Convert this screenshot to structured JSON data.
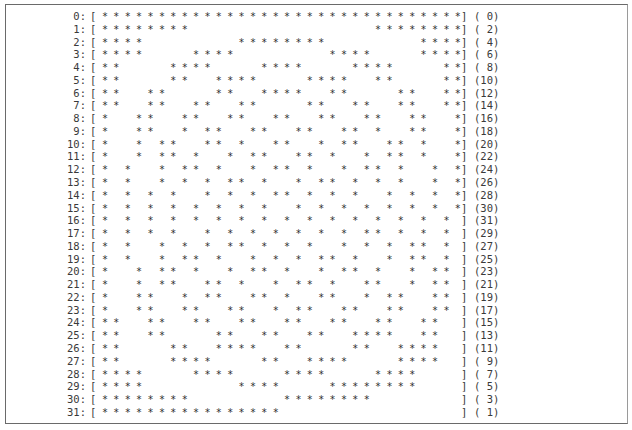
{
  "document": {
    "type": "bit-pattern printout",
    "columns": 32,
    "symbol": "*",
    "left_bracket": "[",
    "right_bracket": "]",
    "rows": [
      {
        "label": "0:",
        "count": "( 0)",
        "cols": [
          0,
          1,
          2,
          3,
          4,
          5,
          6,
          7,
          8,
          9,
          10,
          11,
          12,
          13,
          14,
          15,
          16,
          17,
          18,
          19,
          20,
          21,
          22,
          23,
          24,
          25,
          26,
          27,
          28,
          29,
          30,
          31
        ]
      },
      {
        "label": "1:",
        "count": "( 2)",
        "cols": [
          0,
          1,
          2,
          3,
          4,
          5,
          6,
          7,
          24,
          25,
          26,
          27,
          28,
          29,
          30,
          31
        ]
      },
      {
        "label": "2:",
        "count": "( 4)",
        "cols": [
          0,
          1,
          2,
          3,
          12,
          13,
          14,
          15,
          16,
          17,
          18,
          19,
          28,
          29,
          30,
          31
        ]
      },
      {
        "label": "3:",
        "count": "( 6)",
        "cols": [
          0,
          1,
          2,
          3,
          8,
          9,
          10,
          11,
          20,
          21,
          22,
          23,
          28,
          29,
          30,
          31
        ]
      },
      {
        "label": "4:",
        "count": "( 8)",
        "cols": [
          0,
          1,
          6,
          7,
          8,
          9,
          14,
          15,
          16,
          17,
          22,
          23,
          24,
          25,
          30,
          31
        ]
      },
      {
        "label": "5:",
        "count": "(10)",
        "cols": [
          0,
          1,
          6,
          7,
          10,
          11,
          12,
          13,
          18,
          19,
          20,
          21,
          24,
          25,
          30,
          31
        ]
      },
      {
        "label": "6:",
        "count": "(12)",
        "cols": [
          0,
          1,
          4,
          5,
          10,
          11,
          14,
          15,
          16,
          17,
          20,
          21,
          26,
          27,
          30,
          31
        ]
      },
      {
        "label": "7:",
        "count": "(14)",
        "cols": [
          0,
          1,
          4,
          5,
          8,
          9,
          12,
          13,
          18,
          19,
          22,
          23,
          26,
          27,
          30,
          31
        ]
      },
      {
        "label": "8:",
        "count": "(16)",
        "cols": [
          0,
          3,
          4,
          7,
          8,
          11,
          12,
          15,
          16,
          19,
          20,
          23,
          24,
          27,
          28,
          31
        ]
      },
      {
        "label": "9:",
        "count": "(18)",
        "cols": [
          0,
          3,
          4,
          7,
          9,
          10,
          13,
          14,
          17,
          18,
          21,
          22,
          24,
          27,
          28,
          31
        ]
      },
      {
        "label": "10:",
        "count": "(20)",
        "cols": [
          0,
          3,
          5,
          6,
          9,
          10,
          12,
          15,
          16,
          19,
          21,
          22,
          25,
          26,
          28,
          31
        ]
      },
      {
        "label": "11:",
        "count": "(22)",
        "cols": [
          0,
          3,
          5,
          6,
          8,
          11,
          13,
          14,
          17,
          18,
          20,
          23,
          25,
          26,
          28,
          31
        ]
      },
      {
        "label": "12:",
        "count": "(24)",
        "cols": [
          0,
          2,
          5,
          7,
          8,
          10,
          13,
          15,
          16,
          18,
          21,
          23,
          24,
          26,
          29,
          31
        ]
      },
      {
        "label": "13:",
        "count": "(26)",
        "cols": [
          0,
          2,
          5,
          7,
          9,
          11,
          12,
          14,
          17,
          19,
          20,
          22,
          24,
          26,
          29,
          31
        ]
      },
      {
        "label": "14:",
        "count": "(28)",
        "cols": [
          0,
          2,
          4,
          6,
          9,
          11,
          13,
          15,
          16,
          18,
          20,
          22,
          25,
          27,
          29,
          31
        ]
      },
      {
        "label": "15:",
        "count": "(30)",
        "cols": [
          0,
          2,
          4,
          6,
          8,
          10,
          12,
          14,
          17,
          19,
          21,
          23,
          25,
          27,
          29,
          31
        ]
      },
      {
        "label": "16:",
        "count": "(31)",
        "cols": [
          0,
          2,
          4,
          6,
          8,
          10,
          12,
          14,
          16,
          18,
          20,
          22,
          24,
          26,
          28,
          30
        ]
      },
      {
        "label": "17:",
        "count": "(29)",
        "cols": [
          0,
          2,
          4,
          6,
          9,
          11,
          13,
          15,
          17,
          19,
          21,
          23,
          24,
          26,
          28,
          30
        ]
      },
      {
        "label": "18:",
        "count": "(27)",
        "cols": [
          0,
          2,
          5,
          7,
          9,
          11,
          12,
          14,
          16,
          18,
          21,
          23,
          25,
          27,
          28,
          30
        ]
      },
      {
        "label": "19:",
        "count": "(25)",
        "cols": [
          0,
          2,
          5,
          7,
          8,
          10,
          13,
          15,
          17,
          19,
          20,
          22,
          25,
          27,
          28,
          30
        ]
      },
      {
        "label": "20:",
        "count": "(23)",
        "cols": [
          0,
          3,
          5,
          6,
          8,
          11,
          13,
          14,
          16,
          19,
          21,
          22,
          24,
          27,
          29,
          30
        ]
      },
      {
        "label": "21:",
        "count": "(21)",
        "cols": [
          0,
          3,
          5,
          6,
          9,
          10,
          12,
          15,
          17,
          18,
          20,
          23,
          24,
          27,
          29,
          30
        ]
      },
      {
        "label": "22:",
        "count": "(19)",
        "cols": [
          0,
          3,
          4,
          7,
          9,
          10,
          13,
          14,
          16,
          19,
          20,
          23,
          25,
          26,
          29,
          30
        ]
      },
      {
        "label": "23:",
        "count": "(17)",
        "cols": [
          0,
          3,
          4,
          7,
          8,
          11,
          12,
          15,
          17,
          18,
          21,
          22,
          25,
          26,
          29,
          30
        ]
      },
      {
        "label": "24:",
        "count": "(15)",
        "cols": [
          0,
          1,
          4,
          5,
          8,
          9,
          12,
          13,
          16,
          17,
          20,
          21,
          24,
          25,
          28,
          29
        ]
      },
      {
        "label": "25:",
        "count": "(13)",
        "cols": [
          0,
          1,
          4,
          5,
          10,
          11,
          14,
          15,
          18,
          19,
          22,
          23,
          24,
          25,
          28,
          29
        ]
      },
      {
        "label": "26:",
        "count": "(11)",
        "cols": [
          0,
          1,
          6,
          7,
          10,
          11,
          12,
          13,
          16,
          17,
          22,
          23,
          26,
          27,
          28,
          29
        ]
      },
      {
        "label": "27:",
        "count": "( 9)",
        "cols": [
          0,
          1,
          6,
          7,
          8,
          9,
          14,
          15,
          18,
          19,
          20,
          21,
          26,
          27,
          28,
          29
        ]
      },
      {
        "label": "28:",
        "count": "( 7)",
        "cols": [
          0,
          1,
          2,
          3,
          8,
          9,
          10,
          11,
          16,
          17,
          18,
          19,
          24,
          25,
          26,
          27
        ]
      },
      {
        "label": "29:",
        "count": "( 5)",
        "cols": [
          0,
          1,
          2,
          3,
          12,
          13,
          14,
          15,
          20,
          21,
          22,
          23,
          24,
          25,
          26,
          27
        ]
      },
      {
        "label": "30:",
        "count": "( 3)",
        "cols": [
          0,
          1,
          2,
          3,
          4,
          5,
          6,
          7,
          16,
          17,
          18,
          19,
          20,
          21,
          22,
          23
        ]
      },
      {
        "label": "31:",
        "count": "( 1)",
        "cols": [
          0,
          1,
          2,
          3,
          4,
          5,
          6,
          7,
          8,
          9,
          10,
          11,
          12,
          13,
          14,
          15
        ]
      }
    ]
  }
}
